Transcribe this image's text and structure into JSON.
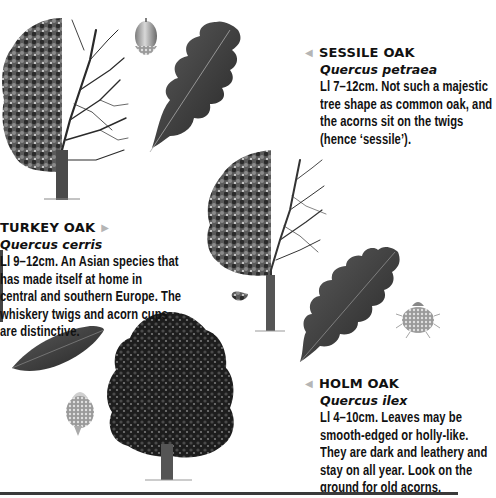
{
  "page": {
    "type": "field-guide-page",
    "colors": {
      "text": "#111111",
      "pointer": "#b5b5b5",
      "foliage": "#3a3a3a",
      "leaf_dark": "#2e2e2e",
      "footer_bar": "#3a3a3a"
    }
  },
  "entries": [
    {
      "id": "sessile",
      "name": "SESSILE OAK",
      "latin": "Quercus petraea",
      "pointer": "left-triangle-icon",
      "text": "Ll 7–12cm. Not such a majestic tree shape as common oak, and the acorns sit on the twigs (hence ‘sessile’)."
    },
    {
      "id": "turkey",
      "name": "TURKEY OAK",
      "latin": "Quercus cerris",
      "pointer": "right-triangle-icon",
      "text": "Ll 9–12cm. An Asian species that has made itself at home in central and southern Europe. The whiskery twigs and acorn cups are distinctive."
    },
    {
      "id": "holm",
      "name": "HOLM OAK",
      "latin": "Quercus ilex",
      "pointer": "left-triangle-icon",
      "text": "Ll 4–10cm. Leaves may be smooth-edged or holly-like. They are dark and leathery and stay on all year. Look on the ground for old acorns."
    }
  ],
  "pointers": {
    "left": "◀",
    "right": "▶"
  },
  "illustrations": [
    {
      "name": "sessile-oak-tree",
      "desc": "half-foliage half-bare tree"
    },
    {
      "name": "sessile-oak-acorn"
    },
    {
      "name": "sessile-oak-leaf"
    },
    {
      "name": "turkey-oak-tree",
      "desc": "half-foliage half-bare tree"
    },
    {
      "name": "turkey-oak-leaf"
    },
    {
      "name": "turkey-oak-acorn-cup"
    },
    {
      "name": "holm-oak-leaf"
    },
    {
      "name": "holm-oak-acorn"
    },
    {
      "name": "holm-oak-tree"
    }
  ]
}
